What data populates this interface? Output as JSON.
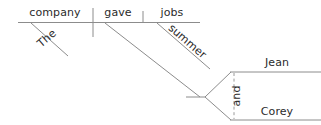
{
  "diagram": {
    "kind": "sentence-diagram",
    "sentence": "The company gave Jean and Corey summer jobs.",
    "stroke_color": "#8c8c8c",
    "text_color": "#2b2b2b",
    "background_color": "#ffffff",
    "words": {
      "subject": "company",
      "verb": "gave",
      "direct_object": "jobs",
      "subject_modifier": "The",
      "object_modifier": "summer",
      "indirect_object_1": "Jean",
      "conjunction": "and",
      "indirect_object_2": "Corey"
    },
    "labels": [
      {
        "id": "the",
        "text": "The",
        "x": 49,
        "y": 41,
        "rotate": -41
      },
      {
        "id": "company",
        "text": "company",
        "x": 55,
        "y": 16,
        "rotate": 0
      },
      {
        "id": "gave",
        "text": "gave",
        "x": 118,
        "y": 16,
        "rotate": 0
      },
      {
        "id": "jobs",
        "text": "jobs",
        "x": 172,
        "y": 16,
        "rotate": 0
      },
      {
        "id": "summer",
        "text": "summer",
        "x": 185,
        "y": 44,
        "rotate": 41
      },
      {
        "id": "jean",
        "text": "Jean",
        "x": 277,
        "y": 66,
        "rotate": 0
      },
      {
        "id": "and",
        "text": "and",
        "x": 240,
        "y": 96,
        "rotate": -90
      },
      {
        "id": "corey",
        "text": "Corey",
        "x": 277,
        "y": 115,
        "rotate": 0
      }
    ],
    "strokes": [
      {
        "id": "main-baseline",
        "type": "line",
        "x1": 18,
        "y1": 22.5,
        "x2": 200,
        "y2": 22.5,
        "style": "solid"
      },
      {
        "id": "subject-verb-divider",
        "type": "line",
        "x1": 93,
        "y1": 8,
        "x2": 93,
        "y2": 37,
        "style": "solid"
      },
      {
        "id": "verb-object-divider",
        "type": "line",
        "x1": 143,
        "y1": 11,
        "x2": 143,
        "y2": 22.5,
        "style": "solid"
      },
      {
        "id": "the-modifier-slant",
        "type": "line",
        "x1": 31,
        "y1": 23,
        "x2": 68,
        "y2": 56,
        "style": "solid"
      },
      {
        "id": "summer-modifier-slant",
        "type": "line",
        "x1": 157,
        "y1": 23,
        "x2": 210,
        "y2": 69,
        "style": "solid"
      },
      {
        "id": "indirect-object-slant",
        "type": "line",
        "x1": 105,
        "y1": 23,
        "x2": 200,
        "y2": 97,
        "style": "solid"
      },
      {
        "id": "indirect-object-stub",
        "type": "line",
        "x1": 186,
        "y1": 97,
        "x2": 205,
        "y2": 97,
        "style": "solid"
      },
      {
        "id": "fork-upper",
        "type": "line",
        "x1": 205,
        "y1": 97,
        "x2": 231,
        "y2": 72,
        "style": "solid"
      },
      {
        "id": "fork-lower",
        "type": "line",
        "x1": 205,
        "y1": 97,
        "x2": 231,
        "y2": 120,
        "style": "solid"
      },
      {
        "id": "jean-baseline",
        "type": "line",
        "x1": 230,
        "y1": 72,
        "x2": 321,
        "y2": 72,
        "style": "solid"
      },
      {
        "id": "corey-baseline",
        "type": "line",
        "x1": 230,
        "y1": 120,
        "x2": 321,
        "y2": 120,
        "style": "solid"
      },
      {
        "id": "conjunction-dashed",
        "type": "line",
        "x1": 234,
        "y1": 73,
        "x2": 234,
        "y2": 119,
        "style": "dashed"
      }
    ]
  }
}
